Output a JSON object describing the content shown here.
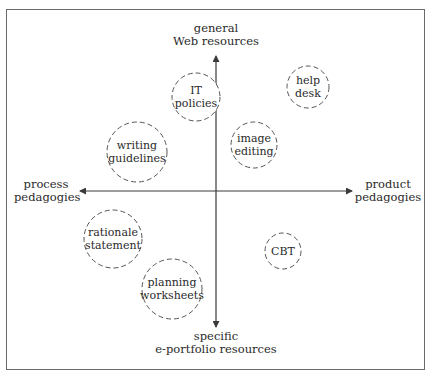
{
  "caption_fragment": "",
  "axes": {
    "top": {
      "line1": "general",
      "line2": "Web resources"
    },
    "bottom": {
      "line1": "specific",
      "line2": "e-portfolio resources"
    },
    "left": {
      "line1": "process",
      "line2": "pedagogies"
    },
    "right": {
      "line1": "product",
      "line2": "pedagogies"
    }
  },
  "nodes": [
    {
      "id": "it-policies",
      "label": "IT\npolicies",
      "cx": 196,
      "cy": 97,
      "r": 24
    },
    {
      "id": "help-desk",
      "label": "help\ndesk",
      "cx": 308,
      "cy": 87,
      "r": 21
    },
    {
      "id": "writing-guidelines",
      "label": "writing\nguidelines",
      "cx": 137,
      "cy": 152,
      "r": 30
    },
    {
      "id": "image-editing",
      "label": "image\nediting",
      "cx": 254,
      "cy": 145,
      "r": 23
    },
    {
      "id": "rationale-statement",
      "label": "rationale\nstatement",
      "cx": 113,
      "cy": 239,
      "r": 29
    },
    {
      "id": "cbt",
      "label": "CBT",
      "cx": 283,
      "cy": 251,
      "r": 18
    },
    {
      "id": "planning-worksheets",
      "label": "planning\nworksheets",
      "cx": 172,
      "cy": 289,
      "r": 30
    }
  ],
  "colors": {
    "axis": "#3a3a3a",
    "circle_stroke": "#555555",
    "frame": "#6a6a6a",
    "text": "#2a2a2a"
  }
}
